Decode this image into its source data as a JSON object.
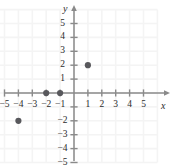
{
  "chart_data": {
    "type": "scatter",
    "title": "",
    "xlabel": "x",
    "ylabel": "y",
    "xlim": [
      -6.2,
      6.6
    ],
    "ylim": [
      -5.9,
      6.1
    ],
    "grid": true,
    "grid_color": "#f4f4f4",
    "axis_color": "#8a8a8a",
    "point_color": "#58585c",
    "legend": null,
    "x_tick_labels": [
      "-5",
      "-4",
      "-3",
      "-2",
      "-1",
      "1",
      "2",
      "3",
      "4",
      "5"
    ],
    "x_tick_values": [
      -5,
      -4,
      -3,
      -2,
      -1,
      1,
      2,
      3,
      4,
      5
    ],
    "y_tick_labels": [
      "5",
      "4",
      "3",
      "2",
      "1",
      "-2",
      "-3",
      "-4",
      "-5"
    ],
    "y_tick_values": [
      5,
      4,
      3,
      2,
      1,
      -2,
      -3,
      -4,
      -5
    ],
    "points": [
      {
        "x": -4,
        "y": -2,
        "label": "(-4, -2)"
      },
      {
        "x": -2,
        "y": 0,
        "label": "(-2, 0)"
      },
      {
        "x": -1,
        "y": 0,
        "label": "(-1, 0)"
      },
      {
        "x": 1,
        "y": 2,
        "label": "(1, 2)"
      }
    ]
  },
  "axes": {
    "x_axis_name": "x",
    "y_axis_name": "y"
  }
}
